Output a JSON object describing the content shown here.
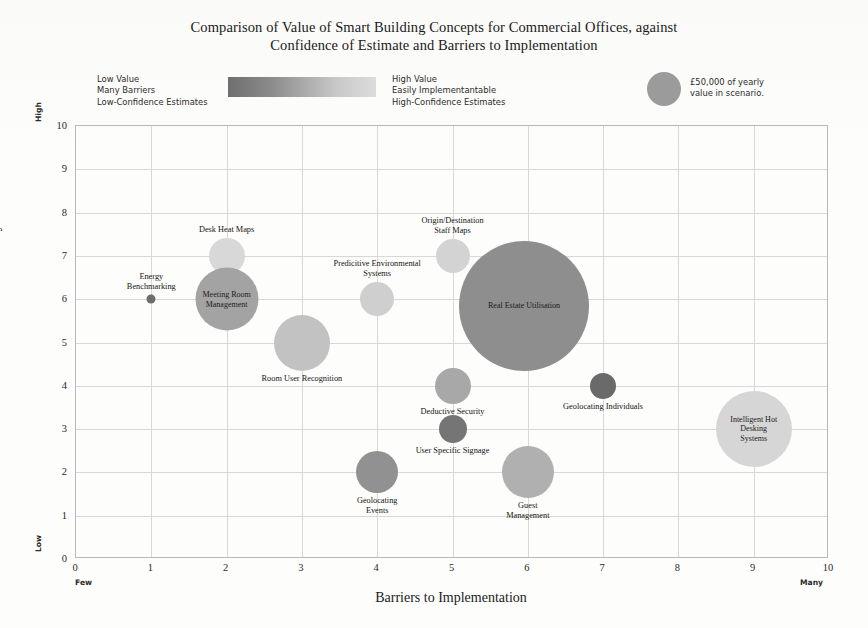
{
  "chart_data": {
    "type": "scatter",
    "title": "Comparison of Value of Smart Building Concepts for Commercial Offices, against Confidence of Estimate and Barriers to Implementation",
    "title_lines": [
      "Comparison of Value of Smart Building Concepts for Commercial Offices, against",
      "Confidence of Estimate and Barriers to Implementation"
    ],
    "xlabel": "Barriers to Implementation",
    "ylabel": "Accuracy of Valuation",
    "xlim": [
      0,
      10
    ],
    "ylim": [
      0,
      10
    ],
    "xticks": [
      "0",
      "1",
      "2",
      "3",
      "4",
      "5",
      "6",
      "7",
      "8",
      "9",
      "10"
    ],
    "yticks": [
      "0",
      "1",
      "2",
      "3",
      "4",
      "5",
      "6",
      "7",
      "8",
      "9",
      "10"
    ],
    "grid": true,
    "x_axis_low_label": "Few",
    "x_axis_high_label": "Many",
    "y_axis_low_label": "Low",
    "y_axis_high_label": "High",
    "legend_position": "top",
    "size_encoding": "bubble area proportional to yearly value in scenario",
    "color_encoding": "darker = low value / many barriers / low-confidence; lighter = high value / easily implementantable / high-confidence",
    "points": [
      {
        "label": "Energy Benchmarking",
        "x": 1,
        "y": 6,
        "size_px": 9,
        "color": "#6d6d6d",
        "label_position": "above",
        "label_lines": "Energy\nBenchmarking"
      },
      {
        "label": "Desk Heat Maps",
        "x": 2,
        "y": 7,
        "size_px": 36,
        "color": "#d8d8d8",
        "label_position": "above",
        "label_lines": "Desk Heat Maps"
      },
      {
        "label": "Meeting Room Management",
        "x": 2,
        "y": 6,
        "size_px": 63,
        "color": "#a3a3a3",
        "label_position": "inside",
        "label_lines": "Meeting Room\nManagement"
      },
      {
        "label": "Room User Recognition",
        "x": 3,
        "y": 5,
        "size_px": 56,
        "color": "#c2c2c2",
        "label_position": "below",
        "label_lines": "Room User Recognition"
      },
      {
        "label": "Predicitive Environmental Systems",
        "x": 4,
        "y": 6,
        "size_px": 34,
        "color": "#cfcfcf",
        "label_position": "above",
        "label_lines": "Predicitive Environmental\nSystems"
      },
      {
        "label": "Geolocating Events",
        "x": 4,
        "y": 2,
        "size_px": 42,
        "color": "#919191",
        "label_position": "below",
        "label_lines": "Geolocating\nEvents"
      },
      {
        "label": "Origin/Destination Staff Maps",
        "x": 5,
        "y": 7,
        "size_px": 34,
        "color": "#d3d3d3",
        "label_position": "above",
        "label_lines": "Origin/Destination\nStaff Maps"
      },
      {
        "label": "Deductive Security",
        "x": 5,
        "y": 4,
        "size_px": 36,
        "color": "#a8a8a8",
        "label_position": "below",
        "label_lines": "Deductive Security"
      },
      {
        "label": "User Specific Signage",
        "x": 5,
        "y": 3,
        "size_px": 28,
        "color": "#757575",
        "label_position": "below",
        "label_lines": "User Specific Signage"
      },
      {
        "label": "Real Estate Utilisation",
        "x": 5.95,
        "y": 5.85,
        "size_px": 130,
        "color": "#8e8e8e",
        "label_position": "inside",
        "label_lines": "Real Estate Utilisation"
      },
      {
        "label": "Guest Management",
        "x": 6,
        "y": 2,
        "size_px": 52,
        "color": "#b0b0b0",
        "label_position": "below",
        "label_lines": "Guest\nManagement"
      },
      {
        "label": "Geolocating Individuals",
        "x": 7,
        "y": 4,
        "size_px": 26,
        "color": "#6a6a6a",
        "label_position": "below",
        "label_lines": "Geolocating Individuals"
      },
      {
        "label": "Intelligent Hot Desking Systems",
        "x": 9,
        "y": 3,
        "size_px": 76,
        "color": "#d6d6d6",
        "label_position": "inside",
        "label_lines": "Intelligent Hot Desking\nSystems"
      }
    ],
    "legend": {
      "low_end_lines": "Low Value\nMany Barriers\nLow-Confidence Estimates",
      "high_end_lines": "High Value\nEasily Implementantable\nHigh-Confidence Estimates",
      "gradient_dark": "#6f6f6f",
      "gradient_light": "#dcdcdc",
      "size_key_lines": "£50,000 of yearly\nvalue in scenario.",
      "size_key_color": "#9b9b9b"
    }
  }
}
